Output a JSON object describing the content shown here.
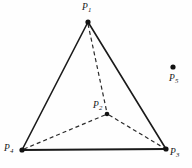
{
  "figure": {
    "name": "tetrahedron-diagram",
    "width": 192,
    "height": 168,
    "background_color": "#fefefe",
    "stroke_color": "#1a1a1a",
    "dash_color": "#2a2a2a"
  },
  "points": [
    {
      "id": "p1",
      "label": "P",
      "subscript": "1",
      "x": 88,
      "y": 22,
      "dot": true,
      "label_x": 82,
      "label_y": 3
    },
    {
      "id": "p2",
      "label": "P",
      "subscript": "2",
      "x": 107,
      "y": 114,
      "dot": true,
      "label_x": 93,
      "label_y": 101
    },
    {
      "id": "p3",
      "label": "P",
      "subscript": "3",
      "x": 166,
      "y": 149,
      "dot": true,
      "label_x": 170,
      "label_y": 148
    },
    {
      "id": "p4",
      "label": "P",
      "subscript": "4",
      "x": 22,
      "y": 150,
      "dot": true,
      "label_x": 4,
      "label_y": 144
    },
    {
      "id": "p5",
      "label": "P",
      "subscript": "5",
      "x": 173,
      "y": 67,
      "dot": true,
      "label_x": 169,
      "label_y": 74
    }
  ],
  "edges": {
    "solid": [
      {
        "name": "edge-p1-p4",
        "from": "p1",
        "to": "p4",
        "x1": 88,
        "y1": 22,
        "x2": 22,
        "y2": 150,
        "width": 1.6
      },
      {
        "name": "edge-p1-p3",
        "from": "p1",
        "to": "p3",
        "x1": 88,
        "y1": 22,
        "x2": 166,
        "y2": 149,
        "width": 1.6
      },
      {
        "name": "edge-p4-p3",
        "from": "p4",
        "to": "p3",
        "x1": 22,
        "y1": 150,
        "x2": 166,
        "y2": 149,
        "width": 2.1
      }
    ],
    "dashed": [
      {
        "name": "edge-p1-p2",
        "from": "p1",
        "to": "p2",
        "x1": 88,
        "y1": 24,
        "x2": 107,
        "y2": 113,
        "width": 1.2,
        "dash": "4 3"
      },
      {
        "name": "edge-p2-p4",
        "from": "p2",
        "to": "p4",
        "x1": 105,
        "y1": 115,
        "x2": 24,
        "y2": 149,
        "width": 1.2,
        "dash": "4 3"
      },
      {
        "name": "edge-p2-p3",
        "from": "p2",
        "to": "p3",
        "x1": 109,
        "y1": 115,
        "x2": 164,
        "y2": 148,
        "width": 1.2,
        "dash": "4 3"
      }
    ]
  },
  "dot_radius": 2.3
}
